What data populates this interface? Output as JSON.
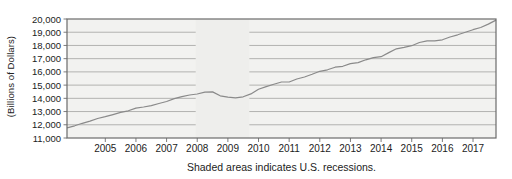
{
  "chart_data": {
    "type": "line",
    "title": "",
    "xlabel": "",
    "ylabel": "(Billions of Dollars)",
    "caption": "Shaded areas indicates U.S. recessions.",
    "grid": "horizontal",
    "legend": "none",
    "x_domain": [
      2003.75,
      2017.75
    ],
    "ylim": [
      11000,
      20000
    ],
    "y_ticks": [
      20000,
      19000,
      18000,
      17000,
      16000,
      15000,
      14000,
      13000,
      12000,
      11000
    ],
    "y_tick_labels": [
      "20,000",
      "19,000",
      "18,000",
      "17,000",
      "16,000",
      "15,000",
      "14,000",
      "13,000",
      "12,000",
      "11,000"
    ],
    "x_ticks": [
      2005,
      2006,
      2007,
      2008,
      2009,
      2010,
      2011,
      2012,
      2013,
      2014,
      2015,
      2016,
      2017
    ],
    "x_tick_labels": [
      "2005",
      "2006",
      "2007",
      "2008",
      "2009",
      "2010",
      "2011",
      "2012",
      "2013",
      "2014",
      "2015",
      "2016",
      "2017"
    ],
    "recessions": [
      {
        "start": 2007.95,
        "end": 2009.7
      }
    ],
    "series": [
      {
        "name": "U.S. GDP",
        "x_start": 2003.75,
        "x_step": 0.25,
        "values": [
          11772,
          11923,
          12113,
          12275,
          12474,
          12610,
          12766,
          12936,
          13058,
          13263,
          13347,
          13453,
          13612,
          13759,
          13977,
          14126,
          14253,
          14328,
          14469,
          14486,
          14191,
          14091,
          14034,
          14115,
          14332,
          14681,
          14889,
          15058,
          15232,
          15239,
          15461,
          15612,
          15818,
          16042,
          16161,
          16357,
          16420,
          16630,
          16699,
          16912,
          17080,
          17145,
          17462,
          17743,
          17852,
          17984,
          18219,
          18344,
          18351,
          18425,
          18638,
          18806,
          18991,
          19190,
          19357,
          19611,
          19918
        ]
      }
    ],
    "colors": {
      "plot_background": "#f2f2f0",
      "recession_fill": "#eeeeec",
      "gridline": "#b2b2b0",
      "frame": "#6b6b6b",
      "line": "#8a8a8a",
      "tick": "#7d7d7d",
      "text": "#1c1c1c"
    }
  }
}
